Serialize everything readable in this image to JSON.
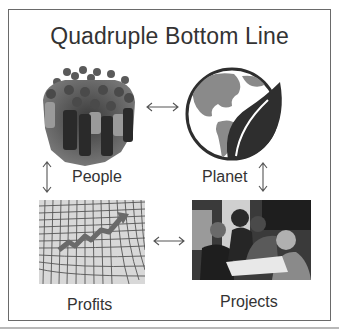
{
  "title": "Quadruple Bottom Line",
  "nodes": [
    {
      "id": "people",
      "label": "People",
      "icon": "crowd-photo"
    },
    {
      "id": "planet",
      "label": "Planet",
      "icon": "globe-leaf-icon"
    },
    {
      "id": "profits",
      "label": "Profits",
      "icon": "rising-chart-grid-photo"
    },
    {
      "id": "projects",
      "label": "Projects",
      "icon": "team-meeting-photo"
    }
  ],
  "connections": [
    {
      "from": "People",
      "to": "Planet",
      "type": "bidirectional"
    },
    {
      "from": "People",
      "to": "Profits",
      "type": "bidirectional"
    },
    {
      "from": "Planet",
      "to": "Projects",
      "type": "bidirectional"
    },
    {
      "from": "Profits",
      "to": "Projects",
      "type": "bidirectional"
    }
  ],
  "colors": {
    "text": "#333333",
    "frame": "#6a6a6a",
    "leaf": "#2e2e2e",
    "land": "#8a8a8a"
  }
}
